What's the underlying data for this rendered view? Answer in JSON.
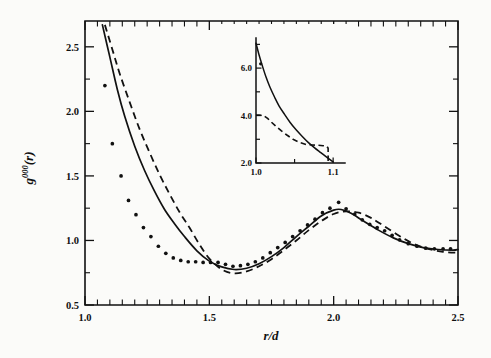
{
  "chart_data": {
    "type": "line",
    "title": "",
    "xlabel": "r/d",
    "ylabel": "g^000(r)",
    "ylabel_base": "g",
    "ylabel_sup": "000",
    "ylabel_arg": "(r)",
    "xlim": [
      1.0,
      2.5
    ],
    "ylim": [
      0.5,
      2.7
    ],
    "grid": false,
    "legend": "none",
    "x_ticks_major": [
      1.0,
      1.5,
      2.0,
      2.5
    ],
    "x_ticklabels": [
      "1.0",
      "1.5",
      "2.0",
      "2.5"
    ],
    "x_tick_minor_step": 0.05,
    "y_ticks_major": [
      0.5,
      1.0,
      1.5,
      2.0,
      2.5
    ],
    "y_ticklabels": [
      "0.5",
      "1.0",
      "1.5",
      "2.0",
      "2.5"
    ],
    "series": [
      {
        "name": "solid-curve",
        "style": "solid",
        "x": [
          1.07,
          1.1,
          1.13,
          1.16,
          1.2,
          1.24,
          1.28,
          1.32,
          1.36,
          1.4,
          1.45,
          1.5,
          1.55,
          1.6,
          1.65,
          1.7,
          1.75,
          1.8,
          1.85,
          1.9,
          1.95,
          2.0,
          2.03,
          2.07,
          2.12,
          2.18,
          2.24,
          2.3,
          2.36,
          2.42,
          2.48,
          2.5
        ],
        "y": [
          2.67,
          2.42,
          2.17,
          1.96,
          1.73,
          1.54,
          1.38,
          1.24,
          1.13,
          1.03,
          0.92,
          0.84,
          0.795,
          0.775,
          0.785,
          0.82,
          0.875,
          0.945,
          1.03,
          1.11,
          1.19,
          1.235,
          1.24,
          1.21,
          1.15,
          1.08,
          1.02,
          0.975,
          0.945,
          0.93,
          0.925,
          0.93
        ]
      },
      {
        "name": "dashed-curve",
        "style": "dashed",
        "x": [
          1.08,
          1.11,
          1.14,
          1.18,
          1.22,
          1.26,
          1.3,
          1.34,
          1.38,
          1.42,
          1.46,
          1.5,
          1.55,
          1.6,
          1.65,
          1.7,
          1.75,
          1.8,
          1.85,
          1.9,
          1.95,
          2.0,
          2.05,
          2.1,
          2.15,
          2.2,
          2.26,
          2.32,
          2.38,
          2.44,
          2.5
        ],
        "y": [
          2.67,
          2.48,
          2.29,
          2.07,
          1.86,
          1.68,
          1.51,
          1.36,
          1.22,
          1.1,
          0.97,
          0.86,
          0.775,
          0.745,
          0.76,
          0.8,
          0.855,
          0.925,
          1.0,
          1.08,
          1.15,
          1.205,
          1.225,
          1.215,
          1.175,
          1.115,
          1.04,
          0.975,
          0.935,
          0.912,
          0.905
        ]
      },
      {
        "name": "dotted-data",
        "style": "dots",
        "x": [
          1.08,
          1.11,
          1.145,
          1.175,
          1.205,
          1.235,
          1.265,
          1.295,
          1.325,
          1.355,
          1.385,
          1.415,
          1.445,
          1.475,
          1.505,
          1.535,
          1.565,
          1.595,
          1.625,
          1.655,
          1.685,
          1.715,
          1.745,
          1.775,
          1.805,
          1.835,
          1.865,
          1.895,
          1.925,
          1.955,
          1.985,
          2.02,
          2.05,
          2.085,
          2.115,
          2.145,
          2.175,
          2.205,
          2.235,
          2.265,
          2.3,
          2.335,
          2.37,
          2.405,
          2.44,
          2.47
        ],
        "y": [
          2.2,
          1.75,
          1.5,
          1.31,
          1.2,
          1.1,
          1.03,
          0.955,
          0.9,
          0.865,
          0.845,
          0.835,
          0.835,
          0.83,
          0.83,
          0.83,
          0.815,
          0.8,
          0.805,
          0.815,
          0.835,
          0.865,
          0.905,
          0.945,
          0.985,
          1.03,
          1.075,
          1.12,
          1.165,
          1.215,
          1.25,
          1.295,
          1.245,
          1.205,
          1.16,
          1.125,
          1.1,
          1.075,
          1.04,
          1.005,
          0.975,
          0.955,
          0.94,
          0.935,
          0.935,
          0.935
        ]
      }
    ],
    "inset": {
      "xlabel": "",
      "ylabel": "",
      "xlim": [
        1.0,
        1.105
      ],
      "ylim": [
        2.0,
        7.1
      ],
      "x_ticks_major": [
        1.0,
        1.1
      ],
      "x_ticklabels": [
        "1.0",
        "1.1"
      ],
      "x_tick_minor": [
        1.05
      ],
      "y_ticks_major": [
        2.0,
        4.0,
        6.0
      ],
      "y_ticklabels": [
        "2.0",
        "4.0",
        "6.0"
      ],
      "y_tick_minor": [
        3.0,
        5.0,
        7.0
      ],
      "series": [
        {
          "name": "inset-solid-curve",
          "style": "solid",
          "x": [
            1.0,
            1.004,
            1.008,
            1.013,
            1.018,
            1.024,
            1.03,
            1.037,
            1.044,
            1.052,
            1.06,
            1.068,
            1.076,
            1.084,
            1.092,
            1.1
          ],
          "y": [
            7.05,
            6.55,
            6.12,
            5.62,
            5.2,
            4.78,
            4.4,
            4.05,
            3.72,
            3.4,
            3.12,
            2.86,
            2.64,
            2.44,
            2.24,
            2.05
          ]
        },
        {
          "name": "inset-dashed-curve",
          "style": "dashed",
          "x": [
            1.0,
            1.004,
            1.01,
            1.015,
            1.02,
            1.026,
            1.033,
            1.04,
            1.048,
            1.057,
            1.065,
            1.073,
            1.08,
            1.087,
            1.092,
            1.0935,
            1.0935
          ],
          "y": [
            4.02,
            4.02,
            4.0,
            3.88,
            3.72,
            3.54,
            3.35,
            3.18,
            3.0,
            2.86,
            2.78,
            2.76,
            2.75,
            2.73,
            2.7,
            2.62,
            2.05
          ]
        },
        {
          "name": "inset-datapoints",
          "style": "dots",
          "x": [
            1.006
          ],
          "y": [
            6.18
          ]
        }
      ]
    }
  }
}
